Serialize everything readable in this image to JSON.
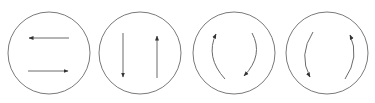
{
  "diagram": {
    "colors": {
      "background": "#ffffff",
      "circle_stroke": "#7a7a7a",
      "arrow_stroke": "#6a6a6a",
      "arrowhead": "#333333"
    },
    "panels": [
      {
        "id": "horizontal-opposite",
        "label": "Horizontal opposing arrows",
        "cx": 49,
        "cy": 53,
        "r": 41,
        "arrows": [
          {
            "kind": "line",
            "x1": 69,
            "y1": 38,
            "x2": 29,
            "y2": 38,
            "direction": "left"
          },
          {
            "kind": "line",
            "x1": 28,
            "y1": 71,
            "x2": 68,
            "y2": 71,
            "direction": "right"
          }
        ]
      },
      {
        "id": "vertical-opposite",
        "label": "Vertical opposing arrows",
        "cx": 140,
        "cy": 53,
        "r": 41,
        "arrows": [
          {
            "kind": "line",
            "x1": 123,
            "y1": 33,
            "x2": 123,
            "y2": 77,
            "direction": "down"
          },
          {
            "kind": "line",
            "x1": 157,
            "y1": 78,
            "x2": 157,
            "y2": 36,
            "direction": "up"
          }
        ]
      },
      {
        "id": "clockwise-arcs",
        "label": "Arcs indicating clockwise rotation",
        "cx": 234,
        "cy": 53,
        "r": 41,
        "arrows": [
          {
            "kind": "arc",
            "d": "M 225 79 Q 205 57 216 34",
            "direction": "up"
          },
          {
            "kind": "arc",
            "d": "M 252 33 Q 264 55 244 76",
            "direction": "down"
          }
        ]
      },
      {
        "id": "counterclockwise-arcs",
        "label": "Arcs indicating counter-clockwise rotation",
        "cx": 327,
        "cy": 53,
        "r": 41,
        "arrows": [
          {
            "kind": "arc",
            "d": "M 313 32 Q 298 55 310 77",
            "direction": "down"
          },
          {
            "kind": "arc",
            "d": "M 345 79 Q 360 57 350 35",
            "direction": "up"
          }
        ]
      }
    ]
  }
}
